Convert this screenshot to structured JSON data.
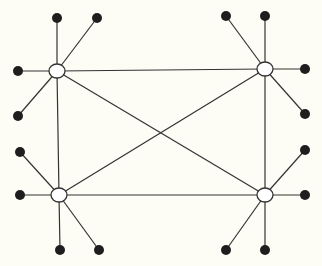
{
  "diagram": {
    "type": "network-graph",
    "background": "#fdfdf5",
    "line_color": "#333333",
    "leaf_color": "#1e1e1e",
    "hub_fill": "#ffffff",
    "hubs": [
      {
        "id": "hub-top-left",
        "x": 57,
        "y": 71
      },
      {
        "id": "hub-top-right",
        "x": 265,
        "y": 69
      },
      {
        "id": "hub-bottom-left",
        "x": 59,
        "y": 195
      },
      {
        "id": "hub-bottom-right",
        "x": 265,
        "y": 195
      }
    ],
    "hub_edges": [
      [
        "hub-top-left",
        "hub-top-right"
      ],
      [
        "hub-top-left",
        "hub-bottom-left"
      ],
      [
        "hub-top-right",
        "hub-bottom-right"
      ],
      [
        "hub-bottom-left",
        "hub-bottom-right"
      ],
      [
        "hub-top-left",
        "hub-bottom-right"
      ],
      [
        "hub-top-right",
        "hub-bottom-left"
      ]
    ],
    "leaves": [
      {
        "hub": "hub-top-left",
        "x": 57,
        "y": 18
      },
      {
        "hub": "hub-top-left",
        "x": 97,
        "y": 18
      },
      {
        "hub": "hub-top-left",
        "x": 18,
        "y": 71
      },
      {
        "hub": "hub-top-left",
        "x": 18,
        "y": 116
      },
      {
        "hub": "hub-top-right",
        "x": 226,
        "y": 16
      },
      {
        "hub": "hub-top-right",
        "x": 265,
        "y": 16
      },
      {
        "hub": "hub-top-right",
        "x": 305,
        "y": 69
      },
      {
        "hub": "hub-top-right",
        "x": 305,
        "y": 114
      },
      {
        "hub": "hub-bottom-left",
        "x": 20,
        "y": 152
      },
      {
        "hub": "hub-bottom-left",
        "x": 20,
        "y": 195
      },
      {
        "hub": "hub-bottom-left",
        "x": 60,
        "y": 250
      },
      {
        "hub": "hub-bottom-left",
        "x": 99,
        "y": 250
      },
      {
        "hub": "hub-bottom-right",
        "x": 305,
        "y": 150
      },
      {
        "hub": "hub-bottom-right",
        "x": 305,
        "y": 195
      },
      {
        "hub": "hub-bottom-right",
        "x": 226,
        "y": 250
      },
      {
        "hub": "hub-bottom-right",
        "x": 265,
        "y": 250
      }
    ]
  }
}
